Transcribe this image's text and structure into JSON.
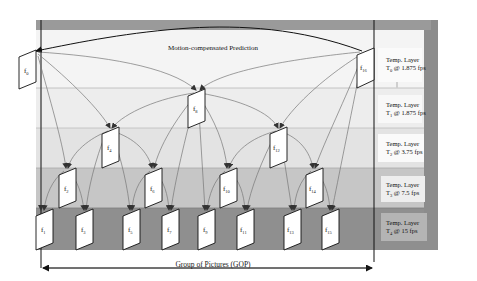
{
  "title": "Motion-compensated Prediction",
  "gop_label": "Group of Pictures (GOP)",
  "colors": {
    "frame_outer": "#8c8c8c",
    "frame_inner": "#d4d4d4",
    "band_t0": "#f3f3f3",
    "band_t1": "#ececec",
    "band_t2": "#e2e2e2",
    "band_t3": "#c4c4c4",
    "band_t4": "#8f8f8f",
    "label_box": "#f7f7f7",
    "arrow": "#6a6a6a",
    "frame_fill": "#ffffff"
  },
  "layers": [
    {
      "id": "T0",
      "line1": "Temp. Layer",
      "line2_prefix": "T",
      "sub": "0",
      "line2_suffix": " @ 1.875 fps"
    },
    {
      "id": "T1",
      "line1": "Temp. Layer",
      "line2_prefix": "T",
      "sub": "1",
      "line2_suffix": " @ 1.875 fps"
    },
    {
      "id": "T2",
      "line1": "Temp. Layer",
      "line2_prefix": "T",
      "sub": "2",
      "line2_suffix": " @ 3.75 fps"
    },
    {
      "id": "T3",
      "line1": "Temp. Layer",
      "line2_prefix": "T",
      "sub": "3",
      "line2_suffix": " @ 7.5 fps"
    },
    {
      "id": "T4",
      "line1": "Temp. Layer",
      "line2_prefix": "T",
      "sub": "4",
      "line2_suffix": " @ 15 fps"
    }
  ],
  "frames": [
    {
      "name": "f",
      "sub": "0",
      "layer": "T0"
    },
    {
      "name": "f",
      "sub": "16",
      "layer": "T0"
    },
    {
      "name": "f",
      "sub": "8",
      "layer": "T1"
    },
    {
      "name": "f",
      "sub": "4",
      "layer": "T2"
    },
    {
      "name": "f",
      "sub": "12",
      "layer": "T2"
    },
    {
      "name": "f",
      "sub": "2",
      "layer": "T3"
    },
    {
      "name": "f",
      "sub": "6",
      "layer": "T3"
    },
    {
      "name": "f",
      "sub": "10",
      "layer": "T3"
    },
    {
      "name": "f",
      "sub": "14",
      "layer": "T3"
    },
    {
      "name": "f",
      "sub": "1",
      "layer": "T4"
    },
    {
      "name": "f",
      "sub": "3",
      "layer": "T4"
    },
    {
      "name": "f",
      "sub": "5",
      "layer": "T4"
    },
    {
      "name": "f",
      "sub": "7",
      "layer": "T4"
    },
    {
      "name": "f",
      "sub": "9",
      "layer": "T4"
    },
    {
      "name": "f",
      "sub": "11",
      "layer": "T4"
    },
    {
      "name": "f",
      "sub": "13",
      "layer": "T4"
    },
    {
      "name": "f",
      "sub": "15",
      "layer": "T4"
    }
  ]
}
